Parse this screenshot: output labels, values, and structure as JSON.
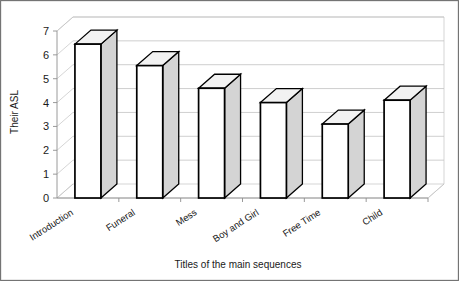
{
  "chart_data": {
    "type": "bar",
    "title": "",
    "xlabel": "Titles of the main sequences",
    "ylabel": "Their ASL",
    "categories": [
      "Introduction",
      "Funeral",
      "Mess",
      "Boy and Girl",
      "Free Time",
      "Child"
    ],
    "values": [
      6.45,
      5.55,
      4.6,
      4.0,
      3.1,
      4.1
    ],
    "ylim": [
      0,
      7
    ],
    "ytick_labels": [
      "0",
      "1",
      "2",
      "3",
      "4",
      "5",
      "6",
      "7"
    ],
    "ytick_values": [
      0,
      1,
      2,
      3,
      4,
      5,
      6,
      7
    ],
    "grid": true,
    "legend": "none",
    "style": "3d-column",
    "colors": {
      "bar_front": "#ffffff",
      "bar_side": "#d4d4d4",
      "bar_top": "#f2f2f2",
      "bar_outline": "#000000",
      "gridline": "#b9b9b9",
      "axis": "#8f8f8f",
      "text": "#1a1a1a",
      "background": "#ffffff",
      "border": "#6e6e6e"
    }
  }
}
